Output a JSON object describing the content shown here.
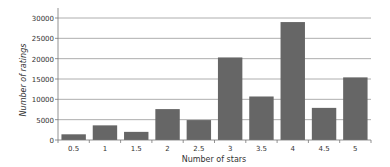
{
  "chart_data": {
    "type": "bar",
    "title": "",
    "xlabel": "Number of stars",
    "ylabel": "Number of ratings",
    "categories": [
      "0.5",
      "1",
      "1.5",
      "2",
      "2.5",
      "3",
      "3.5",
      "4",
      "4.5",
      "5"
    ],
    "values": [
      1400,
      3600,
      2000,
      7600,
      4900,
      20300,
      10700,
      29000,
      7900,
      15400
    ],
    "ylim": [
      0,
      30000
    ],
    "yticks": [
      0,
      5000,
      10000,
      15000,
      20000,
      25000,
      30000
    ],
    "grid": true,
    "legend": "none",
    "bar_color": "#666666",
    "grid_color": "#999999"
  }
}
